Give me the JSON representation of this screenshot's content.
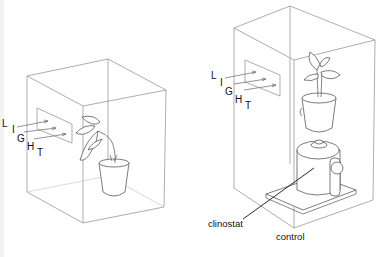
{
  "figure": {
    "left_panel": {
      "light_letters": [
        "L",
        "I",
        "G",
        "H",
        "T"
      ],
      "description": "plant in box lit through side window, bending toward light"
    },
    "right_panel": {
      "light_letters": [
        "L",
        "I",
        "G",
        "H",
        "T"
      ],
      "labels": {
        "clinostat": "clinostat",
        "control": "control"
      },
      "description": "plant on rotating clinostat in box lit through side window"
    },
    "colors": {
      "line": "#555555",
      "box_edge": "#8a8a8a",
      "text": "#111111"
    }
  }
}
